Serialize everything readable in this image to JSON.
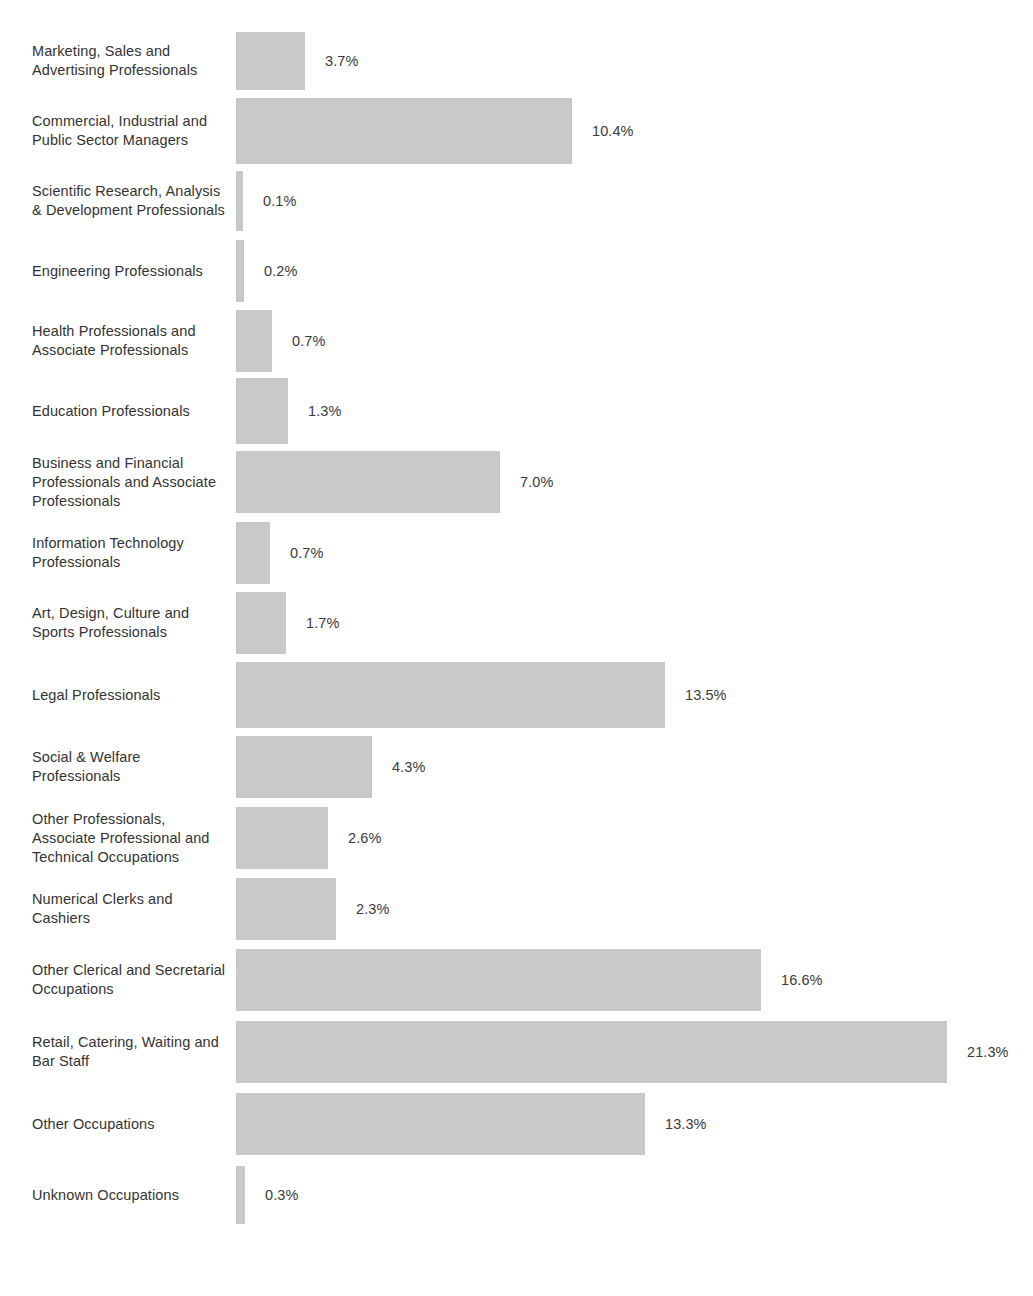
{
  "chart_data": {
    "type": "bar",
    "orientation": "horizontal",
    "title": "",
    "subtitle": "",
    "xlabel": "",
    "ylabel": "",
    "grid": false,
    "legend": null,
    "value_suffix": "%",
    "xlim": [
      0,
      21.3
    ],
    "bar_color": "#c9c9c9",
    "label_color": "#333333",
    "background": "#ffffff",
    "categories": [
      "Marketing, Sales and Advertising Professionals",
      "Commercial, Industrial and Public Sector Managers",
      "Scientific Research, Analysis & Development Professionals",
      "Engineering Professionals",
      "Health Professionals and Associate Professionals",
      "Education Professionals",
      "Business and Financial Professionals and Associate Professionals",
      "Information Technology Professionals",
      "Art, Design, Culture and Sports Professionals",
      "Legal Professionals",
      "Social & Welfare Professionals",
      "Other Professionals, Associate Professional and Technical Occupations",
      "Numerical Clerks and Cashiers",
      "Other Clerical and Secretarial Occupations",
      "Retail, Catering, Waiting and Bar Staff",
      "Other Occupations",
      "Unknown Occupations"
    ],
    "values": [
      3.7,
      10.4,
      0.1,
      0.2,
      0.7,
      1.3,
      7.0,
      0.7,
      1.7,
      13.5,
      4.3,
      2.6,
      2.3,
      16.6,
      21.3,
      13.3,
      0.3
    ],
    "value_labels": [
      "3.7%",
      "10.4%",
      "0.1%",
      "0.2%",
      "0.7%",
      "1.3%",
      "7.0%",
      "0.7%",
      "1.7%",
      "13.5%",
      "4.3%",
      "2.6%",
      "2.3%",
      "16.6%",
      "21.3%",
      "13.3%",
      "0.3%"
    ]
  },
  "rows": [
    {
      "label": "Marketing, Sales and Advertising Professionals",
      "value": 3.7,
      "value_label": "3.7%",
      "bar_px": 69,
      "row_h": 70,
      "bar_h": 58
    },
    {
      "label": "Commercial, Industrial and Public Sector Managers",
      "value": 10.4,
      "value_label": "10.4%",
      "bar_px": 336,
      "row_h": 70,
      "bar_h": 66
    },
    {
      "label": "Scientific Research, Analysis & Development Professionals",
      "value": 0.1,
      "value_label": "0.1%",
      "bar_px": 7,
      "row_h": 70,
      "bar_h": 60
    },
    {
      "label": "Engineering Professionals",
      "value": 0.2,
      "value_label": "0.2%",
      "bar_px": 8,
      "row_h": 70,
      "bar_h": 62
    },
    {
      "label": "Health Professionals and Associate Professionals",
      "value": 0.7,
      "value_label": "0.7%",
      "bar_px": 36,
      "row_h": 70,
      "bar_h": 62
    },
    {
      "label": "Education Professionals",
      "value": 1.3,
      "value_label": "1.3%",
      "bar_px": 52,
      "row_h": 70,
      "bar_h": 66
    },
    {
      "label": "Business and Financial Professionals and Associate Professionals",
      "value": 7.0,
      "value_label": "7.0%",
      "bar_px": 264,
      "row_h": 72,
      "bar_h": 62
    },
    {
      "label": "Information Technology Professionals",
      "value": 0.7,
      "value_label": "0.7%",
      "bar_px": 34,
      "row_h": 70,
      "bar_h": 62
    },
    {
      "label": "Art, Design, Culture and Sports Professionals",
      "value": 1.7,
      "value_label": "1.7%",
      "bar_px": 50,
      "row_h": 70,
      "bar_h": 62
    },
    {
      "label": "Legal Professionals",
      "value": 13.5,
      "value_label": "13.5%",
      "bar_px": 429,
      "row_h": 74,
      "bar_h": 66
    },
    {
      "label": "Social & Welfare Professionals",
      "value": 4.3,
      "value_label": "4.3%",
      "bar_px": 136,
      "row_h": 70,
      "bar_h": 62
    },
    {
      "label": "Other Professionals, Associate Professional and Technical Occupations",
      "value": 2.6,
      "value_label": "2.6%",
      "bar_px": 92,
      "row_h": 72,
      "bar_h": 62
    },
    {
      "label": "Numerical Clerks and Cashiers",
      "value": 2.3,
      "value_label": "2.3%",
      "bar_px": 100,
      "row_h": 70,
      "bar_h": 62
    },
    {
      "label": "Other Clerical and Secretarial Occupations",
      "value": 16.6,
      "value_label": "16.6%",
      "bar_px": 525,
      "row_h": 72,
      "bar_h": 62
    },
    {
      "label": "Retail, Catering, Waiting and Bar Staff",
      "value": 21.3,
      "value_label": "21.3%",
      "bar_px": 711,
      "row_h": 72,
      "bar_h": 62
    },
    {
      "label": "Other Occupations",
      "value": 13.3,
      "value_label": "13.3%",
      "bar_px": 409,
      "row_h": 72,
      "bar_h": 62
    },
    {
      "label": "Unknown Occupations",
      "value": 0.3,
      "value_label": "0.3%",
      "bar_px": 9,
      "row_h": 70,
      "bar_h": 58
    }
  ]
}
